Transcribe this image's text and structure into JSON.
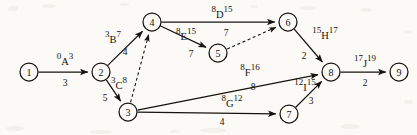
{
  "diagram": {
    "type": "project-network",
    "ink_color": "#16130f",
    "paper_color": "#fbfaf7"
  },
  "nodes": [
    {
      "id": "1",
      "label": "1",
      "x": 29,
      "y": 72,
      "r": 9
    },
    {
      "id": "2",
      "label": "2",
      "x": 101,
      "y": 72,
      "r": 9
    },
    {
      "id": "3",
      "label": "3",
      "x": 128,
      "y": 112,
      "r": 9
    },
    {
      "id": "4",
      "label": "4",
      "x": 152,
      "y": 22,
      "r": 9
    },
    {
      "id": "5",
      "label": "5",
      "x": 218,
      "y": 53,
      "r": 9
    },
    {
      "id": "6",
      "label": "6",
      "x": 288,
      "y": 22,
      "r": 9
    },
    {
      "id": "7",
      "label": "7",
      "x": 289,
      "y": 114,
      "r": 9
    },
    {
      "id": "8",
      "label": "8",
      "x": 331,
      "y": 72,
      "r": 9
    },
    {
      "id": "9",
      "label": "9",
      "x": 399,
      "y": 72,
      "r": 9
    }
  ],
  "edges": [
    {
      "id": "A",
      "from": "1",
      "to": "2",
      "style": "solid",
      "activity": "A",
      "early_start": "0",
      "late_finish": "3",
      "duration": "3",
      "label_x": 65,
      "label_y": 60,
      "dur_x": 65,
      "dur_y": 84
    },
    {
      "id": "B",
      "from": "2",
      "to": "4",
      "style": "solid",
      "activity": "B",
      "early_start": "3",
      "late_finish": "7",
      "duration": "4",
      "label_x": 113,
      "label_y": 38,
      "dur_x": 125,
      "dur_y": 53
    },
    {
      "id": "C",
      "from": "2",
      "to": "3",
      "style": "solid",
      "activity": "C",
      "early_start": "3",
      "late_finish": "8",
      "duration": "5",
      "label_x": 119,
      "label_y": 84,
      "dur_x": 105,
      "dur_y": 99
    },
    {
      "id": "D",
      "from": "4",
      "to": "6",
      "style": "solid",
      "activity": "D",
      "early_start": "8",
      "late_finish": "15",
      "duration": "7",
      "label_x": 222,
      "label_y": 13,
      "dur_x": 226,
      "dur_y": 34
    },
    {
      "id": "E",
      "from": "4",
      "to": "5",
      "style": "solid",
      "activity": "E",
      "early_start": "8",
      "late_finish": "15",
      "duration": "7",
      "label_x": 186,
      "label_y": 35,
      "dur_x": 191,
      "dur_y": 55
    },
    {
      "id": "H",
      "from": "6",
      "to": "8",
      "style": "solid",
      "activity": "H",
      "early_start": "15",
      "late_finish": "17",
      "duration": "2",
      "label_x": 325,
      "label_y": 34,
      "dur_x": 304,
      "dur_y": 57
    },
    {
      "id": "F",
      "from": "3",
      "to": "8",
      "style": "solid",
      "activity": "F",
      "early_start": "8",
      "late_finish": "16",
      "duration": "8",
      "label_x": 250,
      "label_y": 71,
      "dur_x": 253,
      "dur_y": 88
    },
    {
      "id": "G",
      "from": "3",
      "to": "7",
      "style": "solid",
      "activity": "G",
      "early_start": "8",
      "late_finish": "12",
      "duration": "4",
      "label_x": 232,
      "label_y": 102,
      "dur_x": 222,
      "dur_y": 123
    },
    {
      "id": "I",
      "from": "7",
      "to": "8",
      "style": "solid",
      "activity": "I",
      "early_start": "12",
      "late_finish": "15",
      "duration": "3",
      "label_x": 305,
      "label_y": 86,
      "dur_x": 311,
      "dur_y": 102
    },
    {
      "id": "J",
      "from": "8",
      "to": "9",
      "style": "solid",
      "activity": "J",
      "early_start": "17",
      "late_finish": "19",
      "duration": "2",
      "label_x": 365,
      "label_y": 62,
      "dur_x": 365,
      "dur_y": 84
    }
  ],
  "dummy_edges": [
    {
      "id": "dummy-3-4",
      "from": "3",
      "to": "4",
      "style": "dashed"
    },
    {
      "id": "dummy-5-6",
      "from": "5",
      "to": "6",
      "style": "dashed"
    }
  ]
}
